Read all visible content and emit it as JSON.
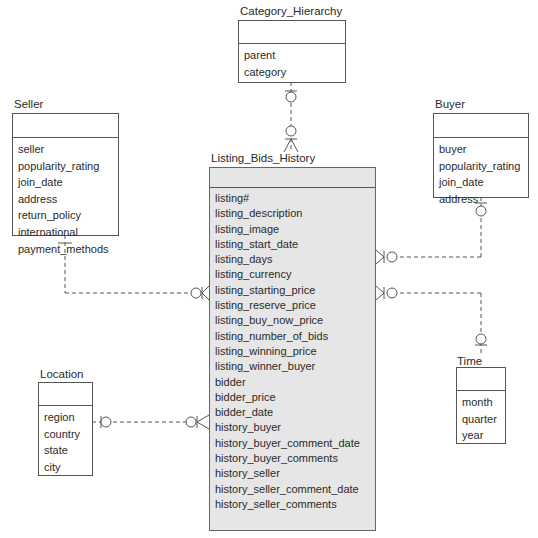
{
  "diagram": {
    "type": "entity-relationship",
    "entities": {
      "category_hierarchy": {
        "name": "Category_Hierarchy",
        "attributes": [
          "parent",
          "category"
        ]
      },
      "seller": {
        "name": "Seller",
        "attributes": [
          "seller",
          "popularity_rating",
          "join_date",
          "address",
          "return_policy",
          "international",
          "payment_methods"
        ]
      },
      "buyer": {
        "name": "Buyer",
        "attributes": [
          "buyer",
          "popularity_rating",
          "join_date",
          "address"
        ]
      },
      "listing_bids_history": {
        "name": "Listing_Bids_History",
        "attributes": [
          "listing#",
          "listing_description",
          "listing_image",
          "listing_start_date",
          "listing_days",
          "listing_currency",
          "listing_starting_price",
          "listing_reserve_price",
          "listing_buy_now_price",
          "listing_number_of_bids",
          "listing_winning_price",
          "listing_winner_buyer",
          "bidder",
          "bidder_price",
          "bidder_date",
          "history_buyer",
          "history_buyer_comment_date",
          "history_buyer_comments",
          "history_seller",
          "history_seller_comment_date",
          "history_seller_comments"
        ]
      },
      "location": {
        "name": "Location",
        "attributes": [
          "region",
          "country",
          "state",
          "city"
        ]
      },
      "time": {
        "name": "Time",
        "attributes": [
          "month",
          "quarter",
          "year"
        ]
      }
    },
    "relationships": [
      {
        "from": "Category_Hierarchy",
        "to": "Listing_Bids_History",
        "from_end": "zero-or-one",
        "to_end": "zero-or-many"
      },
      {
        "from": "Seller",
        "to": "Listing_Bids_History",
        "from_end": "one",
        "to_end": "zero-or-many"
      },
      {
        "from": "Buyer",
        "to": "Listing_Bids_History",
        "from_end": "zero-or-one",
        "to_end": "zero-or-many"
      },
      {
        "from": "Time",
        "to": "Listing_Bids_History",
        "from_end": "zero-or-one",
        "to_end": "zero-or-many"
      },
      {
        "from": "Location",
        "to": "Listing_Bids_History",
        "from_end": "zero-or-one",
        "to_end": "zero-or-many"
      }
    ],
    "colors": {
      "line": "#555555",
      "fact_fill": "#e6e6e6",
      "dim_fill": "#ffffff"
    }
  }
}
